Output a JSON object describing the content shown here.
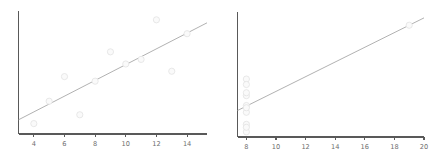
{
  "figure": {
    "width": 430,
    "height": 163,
    "background": "#ffffff",
    "panel_count": 2
  },
  "style": {
    "marker_fill": "#fafafa",
    "marker_edge": "#e4e4e4",
    "line_color": "#a8a8a8",
    "spine_color": "#595959",
    "tick_label_color": "#6e6e6e"
  },
  "chart_data": [
    {
      "type": "scatter",
      "name": "panel-left",
      "title": "",
      "xlabel": "",
      "ylabel": "",
      "xlim": [
        3.0,
        15.3
      ],
      "ylim": [
        3.6,
        11.4
      ],
      "xticks": [
        4,
        6,
        8,
        10,
        12,
        14
      ],
      "xticklabels": [
        "4",
        "6",
        "8",
        "10",
        "12",
        "14"
      ],
      "yticks": [],
      "yticklabels": [],
      "grid": false,
      "legend": false,
      "series": [
        {
          "name": "observations",
          "marker": "o",
          "x": [
            10.0,
            8.0,
            13.0,
            9.0,
            11.0,
            14.0,
            6.0,
            4.0,
            12.0,
            7.0,
            5.0
          ],
          "y": [
            8.04,
            6.95,
            7.58,
            8.81,
            8.33,
            9.96,
            7.24,
            4.26,
            10.84,
            4.82,
            5.68
          ]
        }
      ],
      "trendline": {
        "name": "linear-fit",
        "slope": 0.5,
        "intercept": 3.0,
        "x_start": 3.0,
        "x_end": 15.3,
        "y_start": 4.5,
        "y_end": 10.65
      }
    },
    {
      "type": "scatter",
      "name": "panel-right",
      "title": "",
      "xlabel": "",
      "ylabel": "",
      "xlim": [
        7.4,
        20.0
      ],
      "ylim": [
        4.9,
        13.4
      ],
      "xticks": [
        8,
        10,
        12,
        14,
        16,
        18,
        20
      ],
      "xticklabels": [
        "8",
        "10",
        "12",
        "14",
        "16",
        "18",
        "20"
      ],
      "yticks": [],
      "yticklabels": [],
      "grid": false,
      "legend": false,
      "series": [
        {
          "name": "observations",
          "marker": "o",
          "x": [
            8.0,
            8.0,
            8.0,
            8.0,
            8.0,
            8.0,
            8.0,
            19.0,
            8.0,
            8.0,
            8.0
          ],
          "y": [
            6.58,
            5.76,
            7.71,
            8.84,
            8.47,
            7.04,
            5.25,
            12.5,
            5.56,
            7.91,
            6.89
          ]
        }
      ],
      "trendline": {
        "name": "linear-fit",
        "slope": 0.5,
        "intercept": 3.0,
        "x_start": 7.4,
        "x_end": 20.0,
        "y_start": 6.7,
        "y_end": 13.0
      }
    }
  ]
}
